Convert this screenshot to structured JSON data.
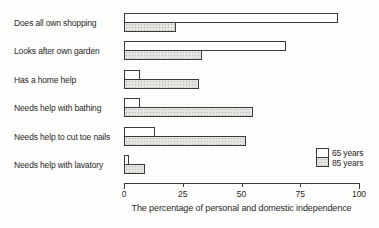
{
  "chart_data": {
    "type": "bar",
    "orientation": "horizontal",
    "title": "",
    "xlabel": "The percentage of personal and domestic independence",
    "xlim": [
      0,
      100
    ],
    "xticks": [
      0,
      25,
      50,
      75,
      100
    ],
    "grid": false,
    "legend_position": "bottom-right",
    "categories": [
      "Does all own shopping",
      "Looks after own garden",
      "Has a home help",
      "Needs help with bathing",
      "Needs help to cut toe nails",
      "Needs help with lavatory"
    ],
    "series": [
      {
        "name": "65 years",
        "fill": "white",
        "values": [
          91,
          69,
          7,
          7,
          13,
          2
        ]
      },
      {
        "name": "85 years",
        "fill": "shaded",
        "values": [
          22,
          33,
          32,
          55,
          52,
          9
        ]
      }
    ]
  },
  "colors": {
    "background": "#fefefd",
    "bar_border": "#3a3a3a",
    "bar_white_fill": "#ffffff",
    "bar_shaded_fill": "#e4e4e1",
    "axis": "#3a3a3a",
    "text": "#272727"
  }
}
